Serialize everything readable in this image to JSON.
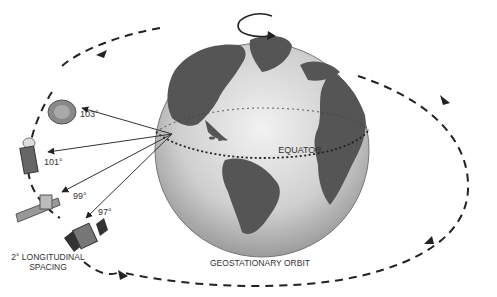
{
  "diagram": {
    "labels": {
      "equator": "EQUATOR",
      "orbit": "GEOSTATIONARY ORBIT",
      "spacing_line1": "2° LONGITUDINAL",
      "spacing_line2": "SPACING"
    },
    "satellites": [
      {
        "longitude": "103°",
        "type": "dish"
      },
      {
        "longitude": "101°",
        "type": "cylinder"
      },
      {
        "longitude": "99°",
        "type": "solar-panel"
      },
      {
        "longitude": "97°",
        "type": "box-panel"
      }
    ],
    "colors": {
      "land": "#555555",
      "ocean": "#c8c8c8",
      "orbit": "#222222"
    }
  }
}
